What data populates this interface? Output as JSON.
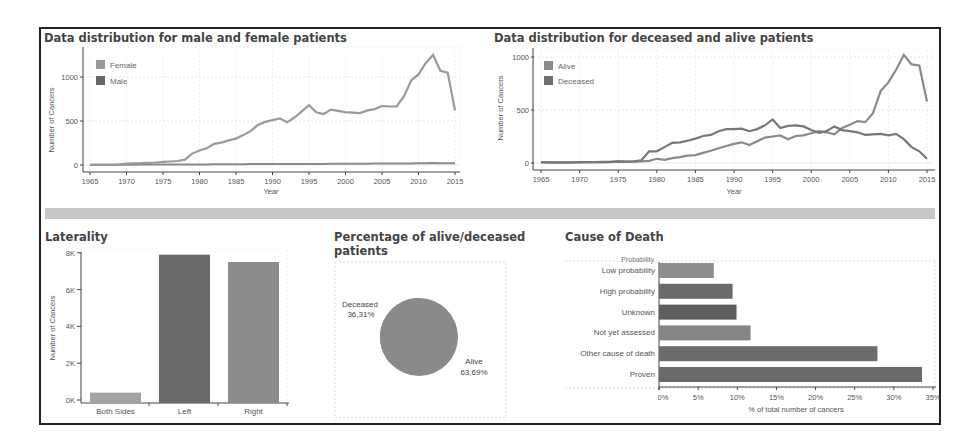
{
  "titles": {
    "gender": "Data distribution for male and female patients",
    "vital": "Data distribution for deceased and alive patients",
    "laterality": "Laterality",
    "pie": "Percentage of alive/deceased patients",
    "pie_line1": "Percentage of alive/deceased",
    "pie_line2": "patients",
    "cause": "Cause of Death"
  },
  "colors": {
    "line_primary": "#8a8a8a",
    "line_secondary": "#6e6e6e",
    "bar_light": "#a3a3a3",
    "bar_dark": "#6a6a6a",
    "bar_mid": "#8c8c8c",
    "banner": "#c8c8c8",
    "pie": "#8a8a8a"
  },
  "chart_data": [
    {
      "id": "gender",
      "type": "line",
      "title": "Data distribution for male and female patients",
      "xlabel": "Year",
      "ylabel": "Number of Cancers",
      "x_ticks": [
        "1965",
        "1970",
        "1975",
        "1980",
        "1985",
        "1990",
        "1995",
        "2000",
        "2005",
        "2010",
        "2015"
      ],
      "y_ticks": [
        "0",
        "500",
        "1000"
      ],
      "xlim": [
        1965,
        2015
      ],
      "ylim": [
        0,
        1300
      ],
      "grid": true,
      "legend": [
        "Female",
        "Male"
      ],
      "legend_position": "top-left",
      "x": [
        1965,
        1966,
        1967,
        1968,
        1969,
        1970,
        1971,
        1972,
        1973,
        1974,
        1975,
        1976,
        1977,
        1978,
        1979,
        1980,
        1981,
        1982,
        1983,
        1984,
        1985,
        1986,
        1987,
        1988,
        1989,
        1990,
        1991,
        1992,
        1993,
        1994,
        1995,
        1996,
        1997,
        1998,
        1999,
        2000,
        2001,
        2002,
        2003,
        2004,
        2005,
        2006,
        2007,
        2008,
        2009,
        2010,
        2011,
        2012,
        2013,
        2014,
        2015
      ],
      "series": [
        {
          "name": "Female",
          "values": [
            5,
            5,
            5,
            5,
            8,
            15,
            18,
            20,
            25,
            28,
            35,
            40,
            45,
            60,
            130,
            165,
            190,
            240,
            255,
            280,
            300,
            340,
            385,
            455,
            490,
            510,
            530,
            485,
            540,
            610,
            680,
            600,
            580,
            630,
            615,
            600,
            595,
            590,
            620,
            635,
            670,
            665,
            665,
            780,
            960,
            1030,
            1160,
            1250,
            1070,
            1050,
            620
          ]
        },
        {
          "name": "Male",
          "values": [
            0,
            0,
            0,
            0,
            2,
            3,
            3,
            4,
            4,
            5,
            5,
            5,
            6,
            6,
            6,
            7,
            7,
            8,
            8,
            8,
            9,
            9,
            10,
            10,
            10,
            11,
            11,
            12,
            12,
            12,
            13,
            13,
            13,
            14,
            14,
            14,
            15,
            15,
            15,
            16,
            16,
            17,
            17,
            18,
            18,
            19,
            20,
            22,
            21,
            20,
            20
          ]
        }
      ]
    },
    {
      "id": "vital",
      "type": "line",
      "title": "Data distribution for deceased and alive patients",
      "xlabel": "Year",
      "ylabel": "Number of Cancers",
      "x_ticks": [
        "1965",
        "1970",
        "1975",
        "1980",
        "1985",
        "1990",
        "1995",
        "2000",
        "2005",
        "2010",
        "2015"
      ],
      "y_ticks": [
        "0",
        "500",
        "1000"
      ],
      "xlim": [
        1965,
        2015
      ],
      "ylim": [
        0,
        1000
      ],
      "grid": true,
      "legend": [
        "Alive",
        "Deceased"
      ],
      "legend_position": "top-left",
      "x": [
        1965,
        1966,
        1967,
        1968,
        1969,
        1970,
        1971,
        1972,
        1973,
        1974,
        1975,
        1976,
        1977,
        1978,
        1979,
        1980,
        1981,
        1982,
        1983,
        1984,
        1985,
        1986,
        1987,
        1988,
        1989,
        1990,
        1991,
        1992,
        1993,
        1994,
        1995,
        1996,
        1997,
        1998,
        1999,
        2000,
        2001,
        2002,
        2003,
        2004,
        2005,
        2006,
        2007,
        2008,
        2009,
        2010,
        2011,
        2012,
        2013,
        2014,
        2015
      ],
      "series": [
        {
          "name": "Alive",
          "values": [
            5,
            5,
            4,
            4,
            5,
            5,
            6,
            6,
            7,
            8,
            15,
            10,
            12,
            15,
            20,
            40,
            30,
            45,
            55,
            70,
            75,
            95,
            115,
            140,
            160,
            180,
            195,
            170,
            205,
            240,
            250,
            260,
            225,
            255,
            260,
            280,
            300,
            290,
            270,
            330,
            360,
            395,
            385,
            470,
            680,
            760,
            880,
            1020,
            930,
            920,
            580
          ]
        },
        {
          "name": "Deceased",
          "values": [
            8,
            7,
            6,
            6,
            7,
            8,
            9,
            9,
            10,
            10,
            15,
            12,
            15,
            25,
            110,
            110,
            150,
            190,
            195,
            210,
            230,
            255,
            265,
            300,
            320,
            320,
            325,
            300,
            320,
            355,
            410,
            330,
            350,
            355,
            345,
            310,
            285,
            300,
            345,
            310,
            300,
            290,
            265,
            270,
            275,
            260,
            275,
            225,
            150,
            110,
            40
          ]
        }
      ]
    },
    {
      "id": "laterality",
      "type": "bar",
      "title": "Laterality",
      "xlabel": "",
      "ylabel": "Number of Cancers",
      "categories": [
        "Both Sides",
        "Left",
        "Right"
      ],
      "values": [
        400,
        7900,
        7500
      ],
      "y_ticks": [
        "0K",
        "2K",
        "4K",
        "6K",
        "8K"
      ],
      "ylim": [
        0,
        8200
      ],
      "grid": false
    },
    {
      "id": "pie",
      "type": "pie",
      "title": "Percentage of alive/deceased patients",
      "slices": [
        {
          "label": "Deceased",
          "pct_label": "36,31%",
          "value": 36.31
        },
        {
          "label": "Alive",
          "pct_label": "63,69%",
          "value": 63.69
        }
      ]
    },
    {
      "id": "cause",
      "type": "bar",
      "orientation": "horizontal",
      "title": "Cause of Death",
      "ylabel": "Probability",
      "xlabel": "% of total number of cancers",
      "categories": [
        "Low probability",
        "High probability",
        "Unknown",
        "Not yet assessed",
        "Other cause of death",
        "Proven"
      ],
      "values": [
        7.0,
        9.4,
        9.9,
        11.7,
        27.9,
        33.6
      ],
      "x_ticks": [
        "0%",
        "5%",
        "10%",
        "15%",
        "20%",
        "25%",
        "30%",
        "35%"
      ],
      "xlim": [
        0,
        35
      ],
      "grid": false
    }
  ]
}
